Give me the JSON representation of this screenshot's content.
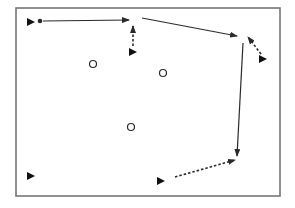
{
  "diagram": {
    "title": "",
    "colors": {
      "stroke": "#2a2a2a",
      "border": "#6e6e6e",
      "background": "#ffffff"
    },
    "frame": {
      "x": 16,
      "y": 8,
      "w": 264,
      "h": 188
    },
    "triangles": [
      {
        "id": "t1",
        "x": 31,
        "y": 22
      },
      {
        "id": "t2",
        "x": 133,
        "y": 52
      },
      {
        "id": "t3",
        "x": 263,
        "y": 59
      },
      {
        "id": "t4",
        "x": 161,
        "y": 181
      },
      {
        "id": "t5",
        "x": 31,
        "y": 176
      }
    ],
    "dots": [
      {
        "id": "d1",
        "x": 40,
        "y": 21
      }
    ],
    "circles": [
      {
        "id": "c1",
        "x": 93,
        "y": 64
      },
      {
        "id": "c2",
        "x": 163,
        "y": 73
      },
      {
        "id": "c3",
        "x": 131,
        "y": 127
      }
    ],
    "arrows": [
      {
        "id": "a1",
        "style": "solid",
        "x1": 43,
        "y1": 21,
        "x2": 129,
        "y2": 20
      },
      {
        "id": "a2",
        "style": "dotted",
        "x1": 133,
        "y1": 46,
        "x2": 133,
        "y2": 26
      },
      {
        "id": "a3",
        "style": "solid",
        "x1": 142,
        "y1": 18,
        "x2": 237,
        "y2": 36
      },
      {
        "id": "a4",
        "style": "dotted",
        "x1": 261,
        "y1": 54,
        "x2": 248,
        "y2": 37
      },
      {
        "id": "a5",
        "style": "solid",
        "x1": 243,
        "y1": 43,
        "x2": 237,
        "y2": 156
      },
      {
        "id": "a6",
        "style": "dotted",
        "x1": 175,
        "y1": 177,
        "x2": 235,
        "y2": 160
      }
    ]
  }
}
